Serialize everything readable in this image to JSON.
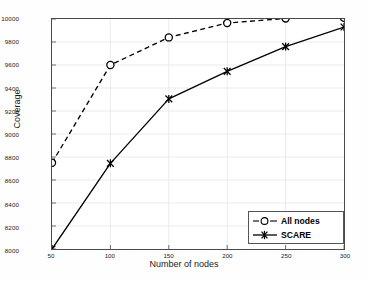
{
  "chart_data": {
    "type": "line",
    "title": "",
    "xlabel": "Number of nodes",
    "ylabel": "Coverage",
    "x": [
      50,
      100,
      150,
      200,
      250,
      300
    ],
    "xticks": [
      "50",
      "100",
      "150",
      "200",
      "250",
      "300"
    ],
    "yticks": [
      "8000",
      "8200",
      "8400",
      "8600",
      "8800",
      "9000",
      "9200",
      "9400",
      "9600",
      "9800",
      "10000"
    ],
    "xlim": [
      50,
      300
    ],
    "ylim": [
      8000,
      10000
    ],
    "grid": true,
    "legend_position": "lower-right",
    "series": [
      {
        "name": "All nodes",
        "values": [
          8750,
          9600,
          9840,
          9965,
          10005,
          10010
        ],
        "line_style": "dashed",
        "marker": "circle",
        "color": "#000000"
      },
      {
        "name": "SCARE",
        "values": [
          8000,
          8745,
          9305,
          9545,
          9760,
          9930
        ],
        "line_style": "solid",
        "marker": "star",
        "color": "#000000"
      }
    ]
  },
  "legend": {
    "entries": [
      {
        "label": "All nodes"
      },
      {
        "label": "SCARE"
      }
    ]
  },
  "colors": {
    "frame": "#4a4a4a",
    "grid": "#e9e9e9",
    "ink": "#000000",
    "background": "#ffffff"
  }
}
